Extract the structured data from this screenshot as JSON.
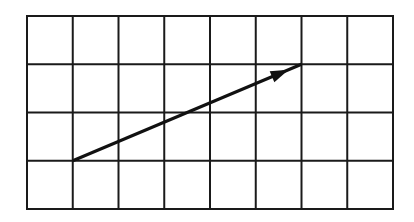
{
  "diagram": {
    "type": "grid-with-vector",
    "grid": {
      "columns": 8,
      "rows": 4,
      "origin_px": [
        27,
        16
      ],
      "width_px": 366,
      "height_px": 193,
      "line_color": "#1a1a1a",
      "line_width": 2
    },
    "vector": {
      "start_cell_corner": [
        1,
        3
      ],
      "end_cell_corner": [
        6,
        1
      ],
      "displacement": {
        "dx": 5,
        "dy": 2
      },
      "color": "#111111",
      "line_width": 3,
      "arrowhead": "filled-triangle"
    },
    "background": "#ffffff"
  }
}
